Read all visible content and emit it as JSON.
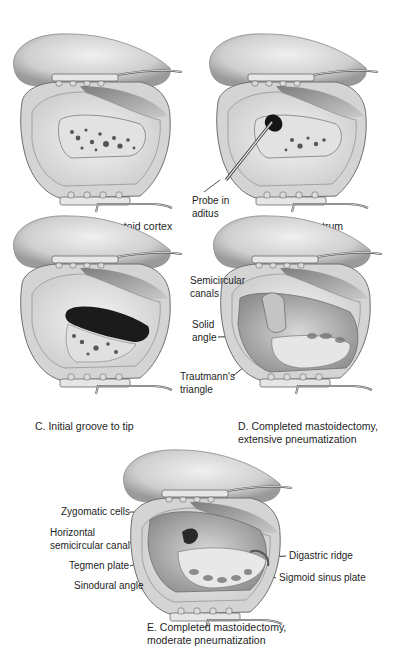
{
  "figure": {
    "panels": [
      {
        "id": "A",
        "caption": "A. Removal of mastoid cortex",
        "labels": []
      },
      {
        "id": "B",
        "caption": "B. Opening into antrum",
        "labels": [
          {
            "line1": "Probe in",
            "line2": "aditus"
          }
        ]
      },
      {
        "id": "C",
        "caption": "C. Initial groove to tip",
        "labels": []
      },
      {
        "id": "D",
        "caption_line1": "D. Completed mastoidectomy,",
        "caption_line2": "extensive pneumatization",
        "labels": [
          {
            "line1": "Semicircular",
            "line2": "canals"
          },
          {
            "line1": "Solid",
            "line2": "angle"
          },
          {
            "line1": "Trautmann's",
            "line2": "triangle"
          }
        ]
      },
      {
        "id": "E",
        "caption_line1": "E. Completed mastoidectomy,",
        "caption_line2": "moderate pneumatization",
        "labels": [
          {
            "text": "Zygomatic cells"
          },
          {
            "line1": "Horizontal",
            "line2": "semicircular canal"
          },
          {
            "text": "Tegmen plate"
          },
          {
            "text": "Sinodural angle"
          },
          {
            "text": "Digastric ridge"
          },
          {
            "text": "Sigmoid sinus plate"
          }
        ]
      }
    ],
    "colors": {
      "background": "#ffffff",
      "skin": "#d9d9d9",
      "bone": "#eaeaea",
      "cavity": "#bdbdbd",
      "dark": "#2a2a2a",
      "text": "#1e1e1e"
    }
  }
}
